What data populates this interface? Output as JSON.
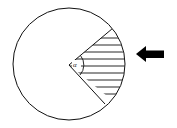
{
  "diagram": {
    "type": "circle-sector",
    "circle": {
      "cx": 69,
      "cy": 64,
      "r": 56
    },
    "sector": {
      "start_deg": -40,
      "end_deg": 40,
      "fill": "hatched",
      "angle_label": "α"
    },
    "arrow": {
      "direction": "left",
      "color": "#000000"
    },
    "stroke_color": "#111111",
    "background": "#ffffff"
  }
}
